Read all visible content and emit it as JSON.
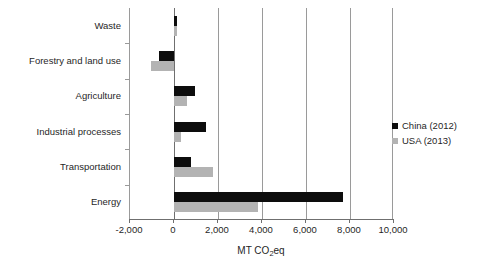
{
  "chart_data": {
    "type": "bar",
    "orientation": "horizontal",
    "title": "",
    "xlabel": "MT CO2eq",
    "xlabel_parts": {
      "pre": "MT CO",
      "sub": "2",
      "post": "eq"
    },
    "ylabel": "",
    "categories": [
      "Waste",
      "Forestry and land use",
      "Agriculture",
      "Industrial processes",
      "Transportation",
      "Energy"
    ],
    "series": [
      {
        "name": "China (2012)",
        "color": "#0d0d0d",
        "values": [
          130,
          -670,
          940,
          1440,
          770,
          7700
        ]
      },
      {
        "name": "USA (2013)",
        "color": "#b3b3b3",
        "values": [
          140,
          -1030,
          580,
          320,
          1750,
          3800
        ]
      }
    ],
    "xlim": [
      -2000,
      10000
    ],
    "xticks": [
      -2000,
      0,
      2000,
      4000,
      6000,
      8000,
      10000
    ],
    "xtick_labels": [
      "-2,000",
      "0",
      "2,000",
      "4,000",
      "6,000",
      "8,000",
      "10,000"
    ],
    "grid": true,
    "grid_axis": "x",
    "legend_position": "right"
  },
  "legend": {
    "entries": [
      {
        "label": "China (2012)",
        "swatch": "china"
      },
      {
        "label": "USA (2013)",
        "swatch": "usa"
      }
    ]
  }
}
